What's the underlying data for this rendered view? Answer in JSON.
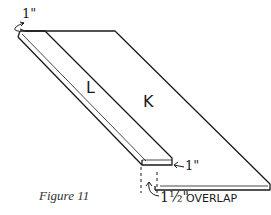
{
  "figure": {
    "caption": "Figure 11",
    "boards": {
      "left_label": "L",
      "right_label": "K"
    },
    "dimensions": {
      "top_offset": "1\"",
      "bottom_offset": "1\"",
      "overlap_number": "1½\"",
      "overlap_text": "OVERLAP"
    },
    "colors": {
      "line": "#1a1a1a",
      "background": "#ffffff",
      "caption": "#333333"
    }
  }
}
